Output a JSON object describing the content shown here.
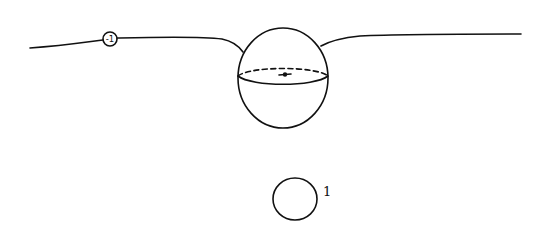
{
  "diagram": {
    "charge_marker": {
      "label": "-1"
    },
    "small_circle": {
      "label": "1"
    },
    "sphere": {
      "has_dashed_equator": true,
      "has_center_point": true
    },
    "ink_color": "#111111",
    "background_color": "#ffffff"
  }
}
